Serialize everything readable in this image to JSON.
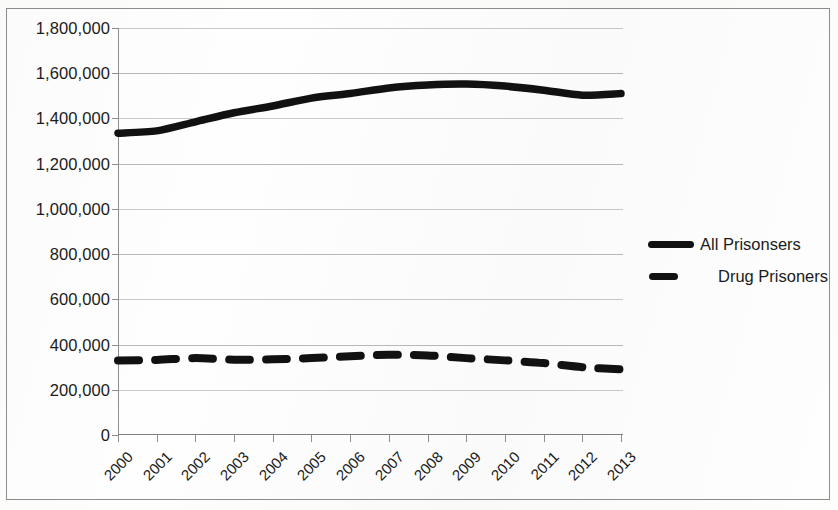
{
  "chart_data": {
    "type": "line",
    "title": "",
    "subtitle": "",
    "xlabel": "",
    "ylabel": "",
    "categories": [
      "2000",
      "2001",
      "2002",
      "2003",
      "2004",
      "2005",
      "2006",
      "2007",
      "2008",
      "2009",
      "2010",
      "2011",
      "2012",
      "2013"
    ],
    "ylim": [
      0,
      1800000
    ],
    "y_ticks": [
      0,
      200000,
      400000,
      600000,
      800000,
      1000000,
      1200000,
      1400000,
      1600000,
      1800000
    ],
    "y_tick_labels": [
      "0",
      "200,000",
      "400,000",
      "600,000",
      "800,000",
      "1,000,000",
      "1,200,000",
      "1,400,000",
      "1,600,000",
      "1,800,000"
    ],
    "grid": true,
    "grid_axis": "y",
    "legend_position": "right",
    "series": [
      {
        "name": "All Prisonsers",
        "style": "solid",
        "color": "#111111",
        "values": [
          1335000,
          1345000,
          1385000,
          1425000,
          1455000,
          1490000,
          1510000,
          1535000,
          1548000,
          1552000,
          1543000,
          1525000,
          1503000,
          1510000
        ]
      },
      {
        "name": "Drug Prisoners",
        "style": "dashed",
        "color": "#111111",
        "values": [
          330000,
          332000,
          340000,
          333000,
          335000,
          340000,
          348000,
          355000,
          352000,
          340000,
          330000,
          318000,
          300000,
          290000
        ]
      }
    ]
  },
  "axes": {
    "y_tick_labels": [
      "1,800,000",
      "1,600,000",
      "1,400,000",
      "1,200,000",
      "1,000,000",
      "800,000",
      "600,000",
      "400,000",
      "200,000",
      "0"
    ],
    "x_tick_labels": [
      "2000",
      "2001",
      "2002",
      "2003",
      "2004",
      "2005",
      "2006",
      "2007",
      "2008",
      "2009",
      "2010",
      "2011",
      "2012",
      "2013"
    ]
  },
  "legend": {
    "items": [
      {
        "label": "All Prisonsers",
        "marker": "solid-line-key"
      },
      {
        "label": "Drug Prisoners",
        "marker": "dashed-line-key"
      }
    ]
  }
}
